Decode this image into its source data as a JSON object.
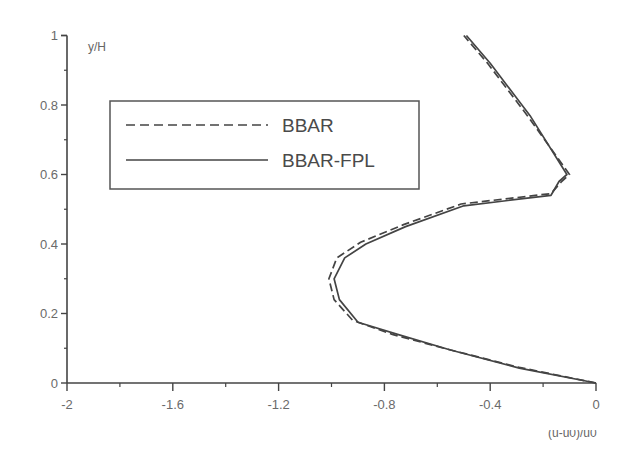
{
  "chart_data": {
    "type": "line",
    "title": "",
    "xlabel": "(u-u0)/u0",
    "ylabel": "y/H",
    "xlim": [
      -2,
      0
    ],
    "ylim": [
      0,
      1
    ],
    "xticks": [
      -2,
      -1.6,
      -1.2,
      -0.8,
      -0.4,
      0
    ],
    "xtick_labels": [
      "-2",
      "-1.6",
      "-1.2",
      "-0.8",
      "-0.4",
      "0"
    ],
    "yticks": [
      0,
      0.2,
      0.4,
      0.6,
      0.8,
      1
    ],
    "ytick_labels": [
      "0",
      "0.2",
      "0.4",
      "0.6",
      "0.8",
      "1"
    ],
    "grid": false,
    "legend_position": "upper-left (inside)",
    "series": [
      {
        "name": "BBAR",
        "style": "dashed",
        "color": "#444444",
        "points": [
          [
            0,
            0
          ],
          [
            -0.29,
            0.045
          ],
          [
            -0.56,
            0.097
          ],
          [
            -0.77,
            0.14
          ],
          [
            -0.92,
            0.18
          ],
          [
            -0.99,
            0.24
          ],
          [
            -1.01,
            0.3
          ],
          [
            -0.98,
            0.36
          ],
          [
            -0.89,
            0.405
          ],
          [
            -0.73,
            0.455
          ],
          [
            -0.51,
            0.515
          ],
          [
            -0.17,
            0.545
          ],
          [
            -0.13,
            0.58
          ],
          [
            -0.1,
            0.6
          ],
          [
            -0.26,
            0.77
          ],
          [
            -0.41,
            0.92
          ],
          [
            -0.5,
            1.0
          ]
        ]
      },
      {
        "name": "BBAR-FPL",
        "style": "solid",
        "color": "#444444",
        "points": [
          [
            0,
            0
          ],
          [
            -0.29,
            0.043
          ],
          [
            -0.55,
            0.095
          ],
          [
            -0.75,
            0.14
          ],
          [
            -0.9,
            0.175
          ],
          [
            -0.97,
            0.24
          ],
          [
            -0.99,
            0.3
          ],
          [
            -0.95,
            0.36
          ],
          [
            -0.87,
            0.4
          ],
          [
            -0.72,
            0.45
          ],
          [
            -0.5,
            0.51
          ],
          [
            -0.17,
            0.54
          ],
          [
            -0.14,
            0.58
          ],
          [
            -0.11,
            0.6
          ],
          [
            -0.25,
            0.77
          ],
          [
            -0.4,
            0.92
          ],
          [
            -0.49,
            1.0
          ]
        ]
      }
    ]
  },
  "legend": {
    "items": [
      {
        "label": "BBAR",
        "style": "dashed"
      },
      {
        "label": "BBAR-FPL",
        "style": "solid"
      }
    ]
  },
  "axes": {
    "ylabel": "y/H",
    "xlabel_partial": "(u-u0)/u0"
  }
}
